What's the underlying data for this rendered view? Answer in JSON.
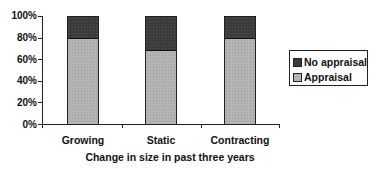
{
  "chart_data": {
    "type": "bar",
    "stacked": true,
    "percent": true,
    "title": "",
    "xlabel": "Change in size in past three years",
    "ylabel": "",
    "ylim": [
      0,
      100
    ],
    "yticks": [
      "0%",
      "20%",
      "40%",
      "60%",
      "80%",
      "100%"
    ],
    "categories": [
      "Growing",
      "Static",
      "Contracting"
    ],
    "series": [
      {
        "name": "Appraisal",
        "values": [
          80,
          69,
          80
        ],
        "color": "#b4b4b4"
      },
      {
        "name": "No appraisal",
        "values": [
          20,
          31,
          20
        ],
        "color": "#3b3b3b"
      }
    ],
    "legend": {
      "position": "right",
      "entries": [
        "No appraisal",
        "Appraisal"
      ]
    },
    "grid": false
  },
  "labels": {
    "y": [
      "100%",
      "80%",
      "60%",
      "40%",
      "20%",
      "0%"
    ],
    "x": [
      "Growing",
      "Static",
      "Contracting"
    ],
    "x_title": "Change in size in past three years",
    "legend": [
      "No appraisal",
      "Appraisal"
    ]
  }
}
